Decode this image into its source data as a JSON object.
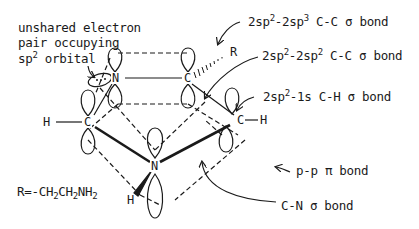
{
  "diagram": {
    "type": "molecular-orbital-diagram",
    "colors": {
      "ink": "#1a1a1a",
      "background": "#ffffff"
    },
    "annotation_left": {
      "line1": "unshared electron",
      "line2": "pair occupying",
      "line3_prefix": "sp",
      "line3_sup": "2",
      "line3_suffix": " orbital"
    },
    "substituent_definition": {
      "prefix": "R=-CH",
      "sub1": "2",
      "mid": "CH",
      "sub2": "2",
      "mid2": "NH",
      "sub3": "2"
    },
    "labels": {
      "cc_sp2_sp3": {
        "a": "2sp",
        "a_sup": "2",
        "b": "-2sp",
        "b_sup": "3",
        "c": " C-C σ bond"
      },
      "cc_sp2_sp2": {
        "a": "2sp",
        "a_sup": "2",
        "b": "-2sp",
        "b_sup": "2",
        "c": " C-C σ bond"
      },
      "ch_sp2_1s": {
        "a": "2sp",
        "a_sup": "2",
        "b": "-1s C-H σ bond"
      },
      "pp_pi": "p-p π bond",
      "cn_sigma": "C-N σ bond"
    },
    "atoms": {
      "n_top": "N",
      "c_top_right": "C",
      "r_group": "R",
      "c_left": "C",
      "h_left": "H",
      "c_right": "C",
      "h_right": "H",
      "n_center": "N",
      "h_bottom": "H"
    }
  }
}
